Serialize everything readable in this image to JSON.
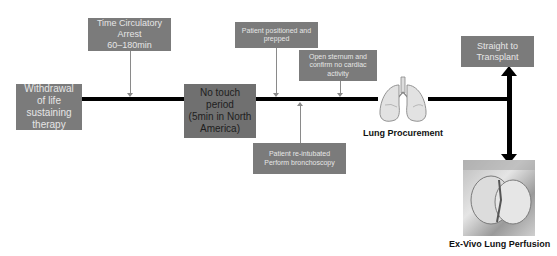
{
  "diagram": {
    "boxes": {
      "withdrawal": {
        "label": "Withdrawal of life sustaining therapy"
      },
      "time_arrest": {
        "line1": "Time Circulatory",
        "line2": "Arrest",
        "line3": "60–180min"
      },
      "no_touch": {
        "line1": "No touch",
        "line2": "period",
        "line3": "(5min in North",
        "line4": "America)"
      },
      "positioned": {
        "line1": "Patient positioned and",
        "line2": "prepped"
      },
      "sternum": {
        "line1": "Open sternum and",
        "line2": "confirm no cardiac",
        "line3": "activity"
      },
      "reintubated": {
        "line1": "Patient re-intubated",
        "line2": "Perform bronchoscopy"
      },
      "transplant": {
        "line1": "Straight to",
        "line2": "Transplant"
      }
    },
    "captions": {
      "lung_procurement": "Lung Procurement",
      "evlp": "Ex-Vivo Lung Perfusion"
    },
    "icons": {
      "lungs": "lungs-icon",
      "evlp_photo": "ex-vivo-lung-photo"
    },
    "colors": {
      "box_fill": "#7b7b7b",
      "box_text": "#e6e6e6",
      "timeline": "#000000",
      "connector": "#8a8a8a"
    }
  }
}
